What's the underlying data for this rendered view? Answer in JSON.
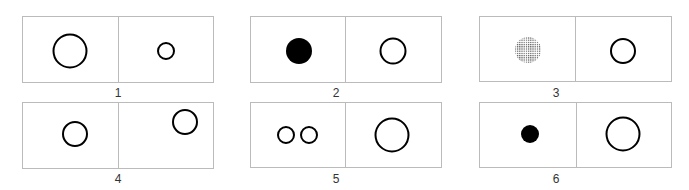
{
  "figure": {
    "panels": [
      {
        "id": "1",
        "label": "1",
        "box": [
          22,
          16,
          191,
          66
        ],
        "divider": 118,
        "shapes": [
          {
            "type": "open-circle",
            "cx": 70,
            "cy": 51,
            "r": 17
          },
          {
            "type": "open-circle",
            "cx": 166,
            "cy": 51,
            "r": 8
          }
        ]
      },
      {
        "id": "2",
        "label": "2",
        "box": [
          250,
          16,
          191,
          66
        ],
        "divider": 345,
        "shapes": [
          {
            "type": "filled-circle",
            "cx": 299,
            "cy": 51,
            "r": 13
          },
          {
            "type": "open-circle",
            "cx": 393,
            "cy": 51,
            "r": 13
          }
        ]
      },
      {
        "id": "3",
        "label": "3",
        "box": [
          479,
          16,
          192,
          65
        ],
        "divider": 575,
        "shapes": [
          {
            "type": "dotted-circle",
            "cx": 528,
            "cy": 50,
            "r": 13
          },
          {
            "type": "open-circle",
            "cx": 623,
            "cy": 51,
            "r": 12
          }
        ]
      },
      {
        "id": "4",
        "label": "4",
        "box": [
          22,
          102,
          191,
          66
        ],
        "divider": 118,
        "shapes": [
          {
            "type": "open-circle",
            "cx": 75,
            "cy": 134,
            "r": 12
          },
          {
            "type": "open-circle",
            "cx": 185,
            "cy": 122,
            "r": 12
          }
        ]
      },
      {
        "id": "5",
        "label": "5",
        "box": [
          250,
          102,
          191,
          65
        ],
        "divider": 345,
        "shapes": [
          {
            "type": "open-circle",
            "cx": 286,
            "cy": 135,
            "r": 8
          },
          {
            "type": "open-circle",
            "cx": 309,
            "cy": 135,
            "r": 8
          },
          {
            "type": "open-circle",
            "cx": 392,
            "cy": 135,
            "r": 17
          }
        ]
      },
      {
        "id": "6",
        "label": "6",
        "box": [
          479,
          102,
          192,
          65
        ],
        "divider": 576,
        "shapes": [
          {
            "type": "filled-circle",
            "cx": 530,
            "cy": 134,
            "r": 9
          },
          {
            "type": "open-circle",
            "cx": 623,
            "cy": 134,
            "r": 17
          }
        ]
      }
    ],
    "colors": {
      "border": "#bbbbbb",
      "stroke": "#000000",
      "fill": "#000000",
      "dots": "#666666"
    }
  }
}
